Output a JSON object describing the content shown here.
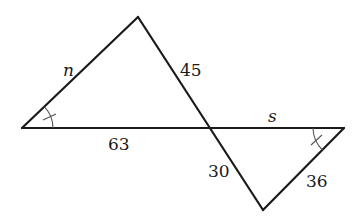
{
  "diagram": {
    "labels": {
      "n": "n",
      "side_45": "45",
      "side_63": "63",
      "s": "s",
      "side_30": "30",
      "side_36": "36"
    },
    "vertices": {
      "left": [
        22,
        128
      ],
      "top": [
        138,
        17
      ],
      "intersection": [
        209,
        128
      ],
      "right": [
        344,
        128
      ],
      "bottom": [
        263,
        210
      ]
    },
    "marked_angles": [
      "left vertex angle",
      "right vertex angle"
    ],
    "colors": {
      "line": "#1a1a1a",
      "angle_mark": "#555555",
      "background": "#ffffff"
    }
  }
}
